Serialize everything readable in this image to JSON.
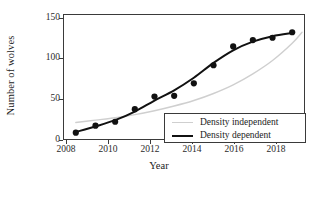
{
  "chart_data": {
    "type": "scatter",
    "title": "",
    "xlabel": "Year",
    "ylabel": "Number of wolves",
    "xlim": [
      2007.4,
      2019.6
    ],
    "ylim": [
      -3,
      155
    ],
    "grid": false,
    "legend_position": "bottom-right",
    "x": [
      2008,
      2009,
      2010,
      2011,
      2012,
      2013,
      2014,
      2015,
      2016,
      2017,
      2018,
      2019
    ],
    "points": {
      "name": "Observed wolf counts",
      "values": [
        5,
        14,
        19,
        35,
        51,
        52,
        68,
        91,
        115,
        123,
        126,
        133
      ],
      "marker": "filled-circle",
      "color": "#111111"
    },
    "series": [
      {
        "name": "Density independent",
        "color": "#cfcfcf",
        "x": [
          2008,
          2009,
          2010,
          2011,
          2012,
          2013,
          2014,
          2015,
          2016,
          2017,
          2018,
          2019,
          2019.5
        ],
        "values": [
          18,
          21,
          24,
          28,
          33,
          39,
          46,
          55,
          66,
          80,
          97,
          119,
          133
        ]
      },
      {
        "name": "Density dependent",
        "color": "#111111",
        "x": [
          2008,
          2009,
          2010,
          2011,
          2012,
          2013,
          2014,
          2015,
          2016,
          2017,
          2018,
          2019
        ],
        "values": [
          6,
          13,
          21,
          32,
          46,
          59,
          75,
          94,
          110,
          121,
          128,
          132
        ]
      }
    ],
    "yticks": [
      0,
      50,
      100,
      150
    ],
    "ytick_labels": [
      "0",
      "50",
      "100",
      "150"
    ],
    "xticks": [
      2008,
      2010,
      2012,
      2014,
      2016,
      2018
    ],
    "xtick_labels": [
      "2008",
      "2010",
      "2012",
      "2014",
      "2016",
      "2018"
    ]
  },
  "legend": {
    "items": [
      {
        "label": "Density independent",
        "color": "#cfcfcf"
      },
      {
        "label": "Density dependent",
        "color": "#111111"
      }
    ]
  }
}
